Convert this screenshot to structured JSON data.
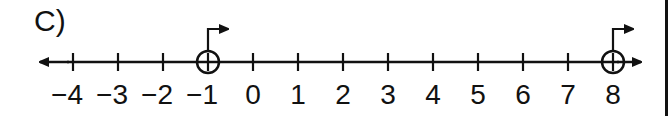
{
  "problem_label": "C)",
  "number_line": {
    "min": -4,
    "max": 8,
    "ticks": [
      "−4",
      "−3",
      "−2",
      "−1",
      "0",
      "1",
      "2",
      "3",
      "4",
      "5",
      "6",
      "7",
      "8"
    ],
    "left_arrow": true,
    "right_arrow": true
  },
  "points": [
    {
      "value": -1,
      "marker": "open-circle",
      "direction_arrow": "right"
    },
    {
      "value": 8,
      "marker": "open-circle",
      "direction_arrow": "right"
    }
  ],
  "colors": {
    "ink": "#111111",
    "background": "#ffffff"
  }
}
